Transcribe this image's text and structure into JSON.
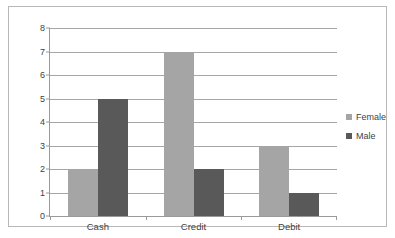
{
  "chart_data": {
    "type": "bar",
    "title": "",
    "subtitle": "",
    "xlabel": "",
    "ylabel": "",
    "categories": [
      "Cash",
      "Credit",
      "Debit"
    ],
    "series": [
      {
        "name": "Female",
        "values": [
          2,
          7,
          3
        ],
        "color": "#a5a5a5"
      },
      {
        "name": "Male",
        "values": [
          5,
          2,
          1
        ],
        "color": "#595959"
      }
    ],
    "ylim": [
      0,
      8
    ],
    "ytick_step": 1,
    "ytick_labels": [
      "0",
      "1",
      "2",
      "3",
      "4",
      "5",
      "6",
      "7",
      "8"
    ],
    "grid": "horizontal",
    "legend_position": "right",
    "border": true,
    "background_color": "#ffffff",
    "grid_color": "#a6a6a6",
    "text_color": "#3f3f3f",
    "border_color": "#b8b8b8"
  },
  "legend": {
    "items": [
      {
        "label": "Female",
        "color": "#a5a5a5"
      },
      {
        "label": "Male",
        "color": "#595959"
      }
    ]
  }
}
